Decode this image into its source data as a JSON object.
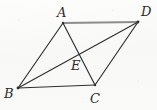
{
  "figure": {
    "kind": "geometry-diagram",
    "shape_name": "quadrilateral-with-diagonals",
    "width": 157,
    "height": 110,
    "background_color": "#fbfbfa",
    "stroke_color": "#2f2f2f",
    "accent_stroke_color": "#8d8d8d",
    "label_color": "#2b2b2b"
  },
  "points": {
    "A": {
      "label": "A",
      "x": 63,
      "y": 23,
      "label_x": 57,
      "label_y": 6
    },
    "B": {
      "label": "B",
      "x": 18,
      "y": 88,
      "label_x": 4,
      "label_y": 87
    },
    "C": {
      "label": "C",
      "x": 95,
      "y": 85,
      "label_x": 90,
      "label_y": 92
    },
    "D": {
      "label": "D",
      "x": 138,
      "y": 22,
      "label_x": 141,
      "label_y": 5
    },
    "E": {
      "label": "E",
      "x": 76,
      "y": 53,
      "label_x": 71,
      "label_y": 59
    }
  },
  "segments": [
    {
      "name": "segment-AD",
      "from": "A",
      "to": "D",
      "style": "thick-gray"
    },
    {
      "name": "segment-AB",
      "from": "A",
      "to": "B",
      "style": "thin-dark"
    },
    {
      "name": "segment-BC",
      "from": "B",
      "to": "C",
      "style": "thin-dark"
    },
    {
      "name": "segment-CD",
      "from": "C",
      "to": "D",
      "style": "thin-dark"
    },
    {
      "name": "diagonal-AC",
      "from": "A",
      "to": "C",
      "style": "thin-dark"
    },
    {
      "name": "diagonal-BD",
      "from": "B",
      "to": "D",
      "style": "thin-dark"
    }
  ],
  "geometry_paths": {
    "outline_AD": "M 63 23 L 138 22",
    "outline_AB": "M 63 23 L 18 88",
    "outline_BC": "M 18 88 L 95 85",
    "outline_CD": "M 95 85 L 138 22",
    "diagonal_AC": "M 63 23 L 95 85",
    "diagonal_BD": "M 18 88 L 138 22"
  },
  "labels_order": [
    "A",
    "D",
    "E",
    "B",
    "C"
  ]
}
